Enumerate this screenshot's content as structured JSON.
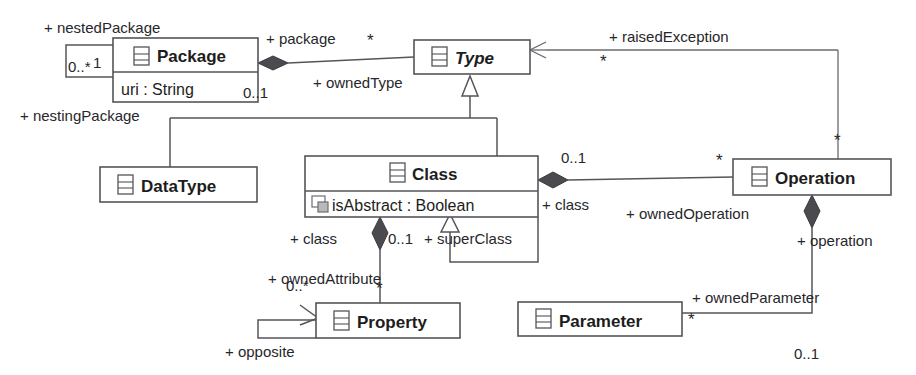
{
  "diagram": {
    "kind": "uml-class-diagram",
    "title": "",
    "stroke_color": "#55555a",
    "fill_color": "#ffffff",
    "text_color": "#1d1d20",
    "diamond_color": "#4a4a4f",
    "classes": [
      {
        "id": "package",
        "name": "Package",
        "abstract": false,
        "icon": "class-icon",
        "attributes": [
          "uri : String"
        ]
      },
      {
        "id": "type",
        "name": "Type",
        "abstract": true,
        "icon": "class-icon",
        "attributes": []
      },
      {
        "id": "datatype",
        "name": "DataType",
        "abstract": false,
        "icon": "class-icon",
        "attributes": []
      },
      {
        "id": "class",
        "name": "Class",
        "abstract": false,
        "icon": "class-icon",
        "attributes": [
          "isAbstract : Boolean"
        ]
      },
      {
        "id": "operation",
        "name": "Operation",
        "abstract": false,
        "icon": "class-icon",
        "attributes": []
      },
      {
        "id": "property",
        "name": "Property",
        "abstract": false,
        "icon": "class-icon",
        "attributes": []
      },
      {
        "id": "parameter",
        "name": "Parameter",
        "abstract": false,
        "icon": "class-icon",
        "attributes": []
      }
    ],
    "role_labels": {
      "nested_package": "+ nestedPackage",
      "nesting_package": "+ nestingPackage",
      "package": "+ package",
      "owned_type": "+ ownedType",
      "raised_exception": "+ raisedException",
      "class_right": "+ class",
      "owned_operation": "+ ownedOperation",
      "class_bottom": "+ class",
      "super_class": "+ superClass",
      "owned_attribute": "+ ownedAttribute",
      "opposite": "+ opposite",
      "operation": "+ operation",
      "owned_parameter": "+ ownedParameter"
    },
    "multiplicities": {
      "nested_package_star": "0..*",
      "nested_package_one": "1",
      "package_star": "*",
      "owned_type_one": "0..1",
      "raised_exception_star": "*",
      "operation_top_star": "*",
      "class_owner_one": "0..1",
      "owned_operation_star": "*",
      "super_class_one": "0..1",
      "owned_attribute_zero_star": "0..*",
      "owned_attribute_star": "*",
      "owned_parameter_star": "*",
      "operation_one": "0..1"
    }
  }
}
